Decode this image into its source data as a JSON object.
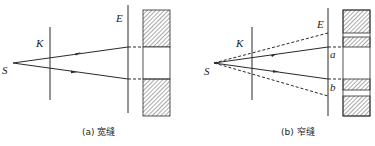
{
  "figure_a": {
    "caption": "(a) 宽缝",
    "labels": {
      "source": "S",
      "slit": "K",
      "screen": "E"
    }
  },
  "figure_b": {
    "caption": "(b) 窄缝",
    "labels": {
      "source": "S",
      "slit": "K",
      "screen": "E",
      "point_a": "a",
      "point_b": "b"
    }
  },
  "colors": {
    "line": "#2a2a2a",
    "hatch": "#555555",
    "background": "#ffffff"
  }
}
